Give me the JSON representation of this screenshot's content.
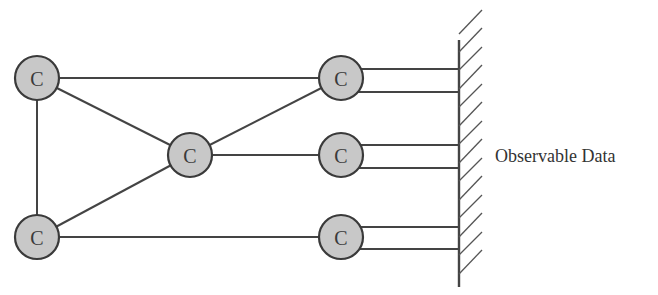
{
  "diagram": {
    "type": "network",
    "nodes": [
      {
        "id": "n1",
        "label": "C",
        "x": 37,
        "y": 78
      },
      {
        "id": "n2",
        "label": "C",
        "x": 37,
        "y": 237
      },
      {
        "id": "n3",
        "label": "C",
        "x": 190,
        "y": 155
      },
      {
        "id": "n4",
        "label": "C",
        "x": 341,
        "y": 78
      },
      {
        "id": "n5",
        "label": "C",
        "x": 341,
        "y": 155
      },
      {
        "id": "n6",
        "label": "C",
        "x": 341,
        "y": 237
      }
    ],
    "edges": [
      [
        "n1",
        "n4"
      ],
      [
        "n1",
        "n3"
      ],
      [
        "n1",
        "n2"
      ],
      [
        "n2",
        "n3"
      ],
      [
        "n2",
        "n6"
      ],
      [
        "n3",
        "n4"
      ],
      [
        "n3",
        "n5"
      ]
    ],
    "output_connections": [
      {
        "from": "n4",
        "count": 2
      },
      {
        "from": "n5",
        "count": 2
      },
      {
        "from": "n6",
        "count": 2
      }
    ],
    "boundary_label": "Observable Data",
    "colors": {
      "node_fill": "#c8c8c8",
      "stroke": "#3a3a3a",
      "text": "#333333"
    }
  }
}
